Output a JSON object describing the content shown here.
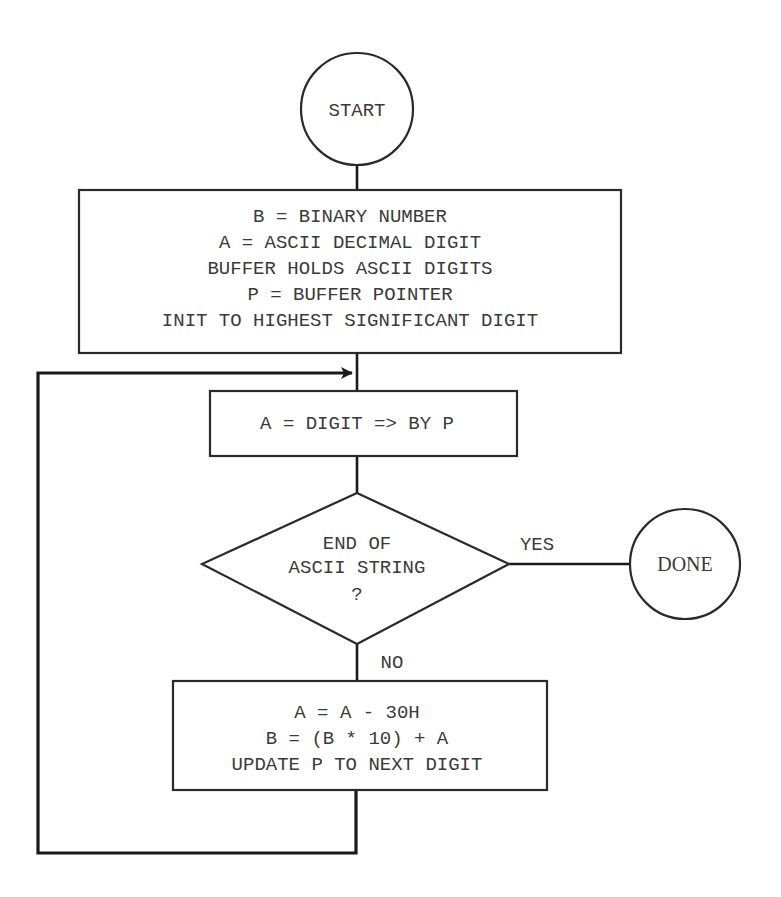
{
  "diagram": {
    "type": "flowchart",
    "nodes": {
      "start": {
        "shape": "circle",
        "label": "START"
      },
      "init": {
        "shape": "rectangle",
        "lines": [
          "B = BINARY NUMBER",
          "A = ASCII DECIMAL DIGIT",
          "BUFFER HOLDS ASCII DIGITS",
          "P = BUFFER POINTER",
          "INIT TO HIGHEST SIGNIFICANT DIGIT"
        ]
      },
      "fetch": {
        "shape": "rectangle",
        "lines": [
          "A = DIGIT => BY P"
        ]
      },
      "decision": {
        "shape": "diamond",
        "lines": [
          "END OF",
          "ASCII STRING",
          "?"
        ]
      },
      "done": {
        "shape": "circle",
        "label": "DONE"
      },
      "convert": {
        "shape": "rectangle",
        "lines": [
          "A = A - 30H",
          "B = (B * 10) + A",
          "UPDATE P TO NEXT DIGIT"
        ]
      }
    },
    "edges": [
      {
        "from": "start",
        "to": "init",
        "label": ""
      },
      {
        "from": "init",
        "to": "fetch",
        "label": ""
      },
      {
        "from": "fetch",
        "to": "decision",
        "label": ""
      },
      {
        "from": "decision",
        "to": "done",
        "label": "YES"
      },
      {
        "from": "decision",
        "to": "convert",
        "label": "NO"
      },
      {
        "from": "convert",
        "to": "fetch",
        "label": "",
        "style": "loop-back-arrow"
      }
    ],
    "colors": {
      "line": "#1a1a1a",
      "text": "#3a3a3a",
      "background": "#ffffff"
    }
  }
}
